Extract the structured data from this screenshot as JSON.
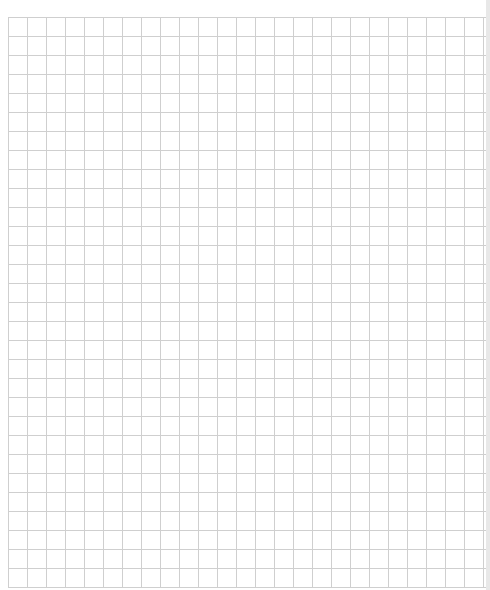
{
  "page": {
    "type": "grid-paper",
    "grid": {
      "cell_size_px": 19,
      "line_color": "#cfcfcf",
      "background": "#ffffff"
    },
    "header_bleed_text": ""
  }
}
